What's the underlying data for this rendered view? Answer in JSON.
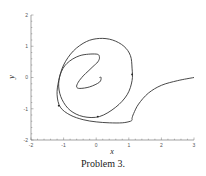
{
  "caption": "Problem 3.",
  "chart_data": {
    "type": "line",
    "title": "",
    "xlabel": "x",
    "ylabel": "y",
    "xlim": [
      -2,
      3
    ],
    "ylim": [
      -2,
      2
    ],
    "xticks": [
      -2,
      -1,
      0,
      1,
      2,
      3
    ],
    "yticks": [
      -2,
      -1,
      0,
      1,
      2
    ],
    "grid": false,
    "legend": null,
    "series": [
      {
        "name": "trajectory",
        "description": "Phase-plane trajectory spiraling inward from (3, 0) toward the origin",
        "x": [
          3.0,
          2.5,
          2.0,
          1.6,
          1.3,
          1.15,
          1.1,
          1.1,
          1.05,
          0.8,
          0.4,
          0.0,
          -0.4,
          -0.8,
          -1.1,
          -1.2,
          -1.15,
          -1.0,
          -0.7,
          -0.3,
          0.1,
          0.5,
          0.85,
          1.05,
          1.1,
          1.1,
          0.95,
          0.6,
          0.1,
          -0.4,
          -0.8,
          -1.05,
          -1.15,
          -1.1,
          -0.9,
          -0.5,
          0.0,
          0.1,
          0.05,
          -0.1,
          -0.25,
          -0.4,
          -0.55,
          -0.6,
          -0.5,
          -0.2,
          0.1,
          0.15,
          0.1
        ],
        "y": [
          0.0,
          -0.1,
          -0.25,
          -0.5,
          -0.85,
          -1.15,
          -1.3,
          -1.35,
          -1.4,
          -1.45,
          -1.45,
          -1.42,
          -1.35,
          -1.2,
          -0.95,
          -0.55,
          -0.1,
          0.4,
          0.85,
          1.15,
          1.25,
          1.2,
          1.0,
          0.7,
          0.3,
          -0.1,
          -0.55,
          -0.95,
          -1.25,
          -1.25,
          -1.05,
          -0.7,
          -0.3,
          0.1,
          0.45,
          0.7,
          0.75,
          0.65,
          0.5,
          0.35,
          0.2,
          0.05,
          -0.15,
          -0.3,
          -0.35,
          -0.3,
          -0.15,
          0.0,
          0.0
        ]
      }
    ],
    "markers": [
      {
        "x": 1.1,
        "y": 0.1
      },
      {
        "x": 0.05,
        "y": -1.25
      },
      {
        "x": -1.15,
        "y": -0.9
      }
    ]
  }
}
